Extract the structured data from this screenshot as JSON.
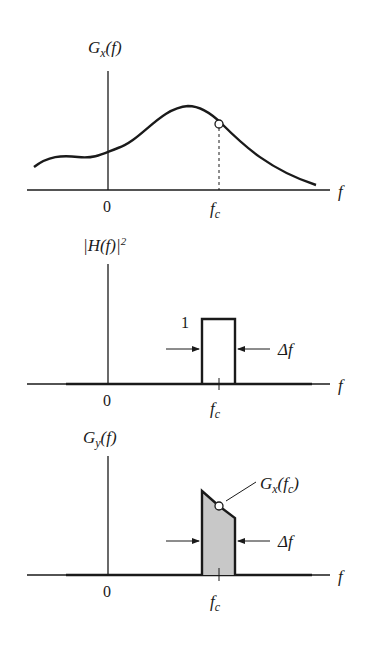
{
  "panels": [
    {
      "id": "input-psd",
      "title_main": "G",
      "title_sub": "x",
      "title_arg": "(f)",
      "x_axis_label": "f",
      "origin_label": "0",
      "center_label_main": "f",
      "center_label_sub": "c"
    },
    {
      "id": "filter-response",
      "title_text": "|H(f)|",
      "title_sup": "2",
      "x_axis_label": "f",
      "origin_label": "0",
      "center_label_main": "f",
      "center_label_sub": "c",
      "height_label": "1",
      "bandwidth_label": "Δf"
    },
    {
      "id": "output-psd",
      "title_main": "G",
      "title_sub": "y",
      "title_arg": "(f)",
      "x_axis_label": "f",
      "origin_label": "0",
      "center_label_main": "f",
      "center_label_sub": "c",
      "point_label_main": "G",
      "point_label_sub": "x",
      "point_label_arg_open": "(",
      "point_label_arg_main": "f",
      "point_label_arg_sub": "c",
      "point_label_arg_close": ")",
      "bandwidth_label": "Δf"
    }
  ],
  "colors": {
    "line": "#1a1a1a",
    "fill": "#c8c8c8",
    "background": "#ffffff"
  }
}
